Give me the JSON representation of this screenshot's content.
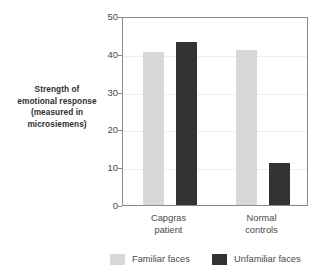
{
  "chart_data": {
    "type": "bar",
    "title": "",
    "subtitle": "",
    "xlabel": "",
    "ylabel": "Strength of emotional response (measured in microsiemens)",
    "ylabel_lines": [
      "Strength of",
      "emotional response",
      "(measured in",
      "microsiemens)"
    ],
    "categories": [
      "Capgras patient",
      "Normal controls"
    ],
    "category_lines": [
      [
        "Capgras",
        "patient"
      ],
      [
        "Normal",
        "controls"
      ]
    ],
    "series": [
      {
        "name": "Familiar faces",
        "values": [
          40.5,
          41.0
        ],
        "color": "#d8d8d8"
      },
      {
        "name": "Unfamiliar faces",
        "values": [
          43.0,
          11.0
        ],
        "color": "#333333"
      }
    ],
    "ylim": [
      0,
      50
    ],
    "yticks": [
      0,
      10,
      20,
      30,
      40,
      50
    ],
    "ytick_labels": [
      "0",
      "10",
      "20",
      "30",
      "40",
      "50"
    ],
    "grid": true,
    "grid_color": "#ededed",
    "legend_position": "bottom",
    "axis_color": "#8a8a8a",
    "background": "#ffffff"
  },
  "legend": {
    "items": [
      {
        "label": "Familiar faces",
        "color": "#d8d8d8"
      },
      {
        "label": "Unfamiliar faces",
        "color": "#333333"
      }
    ]
  }
}
